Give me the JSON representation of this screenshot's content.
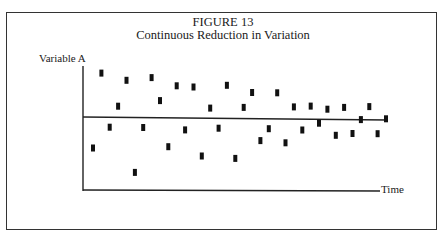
{
  "figure": {
    "label": "FIGURE 13",
    "title": "Continuous Reduction in Variation",
    "y_axis_label": "Variable A",
    "x_axis_label": "Time"
  },
  "chart_data": {
    "type": "scatter",
    "xlabel": "Time",
    "ylabel": "Variable A",
    "grid": false,
    "legend": null,
    "reference_line": {
      "y": 0,
      "label": "center line"
    },
    "annotations": [],
    "note": "Values in relative units; center line = 0, positive up. Scatter of points converging toward center line over time.",
    "x": [
      1,
      2,
      3,
      4,
      5,
      6,
      7,
      8,
      9,
      10,
      11,
      12,
      13,
      14,
      15,
      16,
      17,
      18,
      19,
      20,
      21,
      22,
      23,
      24,
      25,
      26,
      27,
      28,
      29,
      30,
      31,
      32,
      33,
      34,
      35,
      36
    ],
    "values": [
      -30,
      45,
      -9,
      12,
      38,
      -54,
      -9,
      41,
      18,
      -28,
      33,
      -11,
      32,
      -37,
      11,
      -9,
      34,
      -39,
      12,
      27,
      -21,
      -9,
      27,
      -23,
      13,
      -10,
      14,
      -3,
      11,
      -15,
      13,
      -13,
      1,
      14,
      -13,
      2
    ]
  }
}
